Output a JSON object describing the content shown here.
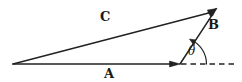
{
  "figure": {
    "background_color": "#ffffff",
    "stroke_color": "#222222",
    "labels": {
      "vector_a": "A",
      "vector_b": "B",
      "vector_c": "C",
      "angle": "θ"
    },
    "geometry": {
      "origin": {
        "x": 13,
        "y": 64
      },
      "vertex_a_tip": {
        "x": 180,
        "y": 64
      },
      "apex": {
        "x": 216,
        "y": 9
      },
      "dashed_line_end": {
        "x": 236,
        "y": 64
      },
      "arc_radius": 26
    },
    "elements": [
      {
        "name": "vector-a-arrow",
        "from": "origin",
        "to": "vertex_a_tip",
        "style": "solid",
        "arrowhead": true
      },
      {
        "name": "vector-b-arrow",
        "from": "vertex_a_tip",
        "to": "apex",
        "style": "solid",
        "arrowhead": true
      },
      {
        "name": "vector-c-arrow",
        "from": "origin",
        "to": "apex",
        "style": "solid",
        "arrowhead": true
      },
      {
        "name": "reference-dashed-line",
        "from": "vertex_a_tip",
        "to": "dashed_line_end",
        "style": "dashed",
        "arrowhead": false
      },
      {
        "name": "angle-arc",
        "style": "solid",
        "arrowhead": true
      }
    ]
  }
}
